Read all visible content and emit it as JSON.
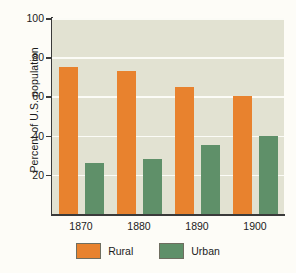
{
  "chart_data": {
    "type": "bar",
    "title": "",
    "subtitle": "",
    "xlabel": "",
    "ylabel": "Percent of U.S. population",
    "categories": [
      "1870",
      "1880",
      "1890",
      "1900"
    ],
    "series": [
      {
        "name": "Rural",
        "color": "#e8822e",
        "values": [
          75,
          73,
          65,
          60
        ]
      },
      {
        "name": "Urban",
        "color": "#5f9069",
        "values": [
          26,
          28,
          35,
          40
        ]
      }
    ],
    "ylim": [
      0,
      100
    ],
    "yticks": [
      "100",
      "80",
      "60",
      "40",
      "20"
    ],
    "ytick_values": [
      100,
      80,
      60,
      40,
      20
    ],
    "grid": true,
    "grid_color": "#fbfbf6",
    "legend_position": "bottom",
    "plot_background": "#e2e2d2",
    "figure_background": "#fdfcf7"
  },
  "legend": {
    "entries": [
      {
        "label": "Rural"
      },
      {
        "label": "Urban"
      }
    ]
  }
}
